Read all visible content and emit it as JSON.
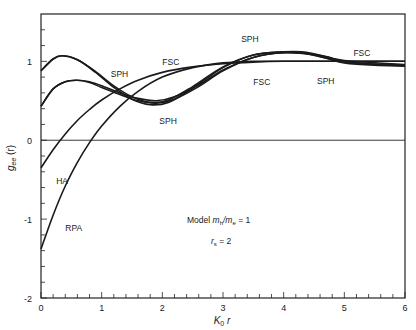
{
  "chart_data": {
    "type": "line",
    "title": "",
    "xlabel": "K₀ r",
    "ylabel": "gₐₐ (r)",
    "xlim": [
      0,
      6
    ],
    "ylim": [
      -2,
      1.6
    ],
    "x_ticks": [
      0,
      1,
      2,
      3,
      4,
      5,
      6
    ],
    "x_tick_labels": [
      "0",
      "1",
      "2",
      "3",
      "4",
      "5",
      "6"
    ],
    "y_ticks": [
      -2,
      -1,
      0,
      1
    ],
    "y_tick_labels": [
      "-2",
      "-1",
      "0",
      "1"
    ],
    "grid": false,
    "zero_line": true,
    "annotation": {
      "line1": "Model  mₕ/mₑ = 1",
      "line2": "rₛ = 2"
    },
    "series": [
      {
        "name": "SPH (upper)",
        "x": [
          0,
          0.2,
          0.35,
          0.6,
          0.9,
          1.2,
          1.5,
          1.8,
          2.1,
          2.5,
          3.0,
          3.5,
          4.0,
          4.3,
          4.7,
          5.0,
          5.5,
          6.0
        ],
        "y": [
          0.88,
          1.03,
          1.07,
          1.02,
          0.86,
          0.67,
          0.52,
          0.45,
          0.48,
          0.66,
          0.92,
          1.08,
          1.12,
          1.11,
          1.04,
          0.98,
          0.95,
          0.94
        ]
      },
      {
        "name": "FSC (upper)",
        "x": [
          0,
          0.2,
          0.35,
          0.6,
          0.9,
          1.2,
          1.5,
          1.8,
          2.1,
          2.5,
          3.0,
          3.5,
          4.0,
          4.3,
          4.7,
          5.0,
          5.5,
          6.0
        ],
        "y": [
          0.88,
          1.03,
          1.07,
          1.02,
          0.87,
          0.69,
          0.55,
          0.48,
          0.51,
          0.68,
          0.93,
          1.08,
          1.12,
          1.12,
          1.06,
          1.0,
          0.96,
          0.95
        ]
      },
      {
        "name": "SPH",
        "x": [
          0,
          0.2,
          0.4,
          0.6,
          0.8,
          1.0,
          1.3,
          1.6,
          1.9,
          2.2,
          2.6,
          3.0,
          3.5,
          4.0,
          4.5,
          5.0,
          6.0
        ],
        "y": [
          0.43,
          0.65,
          0.74,
          0.76,
          0.73,
          0.67,
          0.58,
          0.5,
          0.47,
          0.52,
          0.68,
          0.88,
          1.05,
          1.11,
          1.08,
          0.99,
          0.95
        ]
      },
      {
        "name": "FSC",
        "x": [
          0,
          0.2,
          0.4,
          0.6,
          0.8,
          1.0,
          1.3,
          1.6,
          1.9,
          2.2,
          2.6,
          3.0,
          3.5,
          4.0,
          4.5,
          5.0,
          6.0
        ],
        "y": [
          0.43,
          0.65,
          0.74,
          0.76,
          0.74,
          0.69,
          0.6,
          0.53,
          0.5,
          0.55,
          0.7,
          0.89,
          1.05,
          1.11,
          1.09,
          1.01,
          0.96
        ]
      },
      {
        "name": "HA",
        "x": [
          0,
          0.2,
          0.4,
          0.6,
          0.8,
          1.0,
          1.3,
          1.6,
          2.0,
          2.5,
          3.0,
          3.5,
          4.0,
          5.0,
          6.0
        ],
        "y": [
          -0.35,
          -0.12,
          0.08,
          0.25,
          0.39,
          0.51,
          0.65,
          0.76,
          0.86,
          0.93,
          0.97,
          0.99,
          1.0,
          1.0,
          1.0
        ]
      },
      {
        "name": "RPA",
        "x": [
          0,
          0.2,
          0.4,
          0.6,
          0.8,
          1.0,
          1.3,
          1.6,
          2.0,
          2.5,
          3.0,
          3.5,
          4.0,
          5.0,
          6.0
        ],
        "y": [
          -1.38,
          -0.95,
          -0.58,
          -0.28,
          -0.03,
          0.18,
          0.43,
          0.62,
          0.8,
          0.92,
          0.98,
          1.0,
          1.0,
          1.0,
          1.0
        ]
      }
    ],
    "labels": [
      {
        "text": "FSC",
        "x": 2.0,
        "y": 0.95
      },
      {
        "text": "SPH",
        "x": 1.15,
        "y": 0.8
      },
      {
        "text": "SPH",
        "x": 1.95,
        "y": 0.2
      },
      {
        "text": "SPH",
        "x": 3.3,
        "y": 1.25
      },
      {
        "text": "FSC",
        "x": 3.5,
        "y": 0.7
      },
      {
        "text": "FSC",
        "x": 5.15,
        "y": 1.07
      },
      {
        "text": "SPH",
        "x": 4.55,
        "y": 0.71
      },
      {
        "text": "HA",
        "x": 0.25,
        "y": -0.55
      },
      {
        "text": "RPA",
        "x": 0.4,
        "y": -1.15
      }
    ]
  },
  "axes": {
    "x_label_main": "K",
    "x_label_sub": "0",
    "x_label_tail": "r",
    "y_label_main": "g",
    "y_label_sub": "ee",
    "y_label_tail": "(r)"
  },
  "annotation": {
    "model_word": "Model",
    "ratio_m1": "m",
    "ratio_sub1": "h",
    "ratio_slash": "/m",
    "ratio_sub2": "e",
    "ratio_eq": "= 1",
    "rs_r": "r",
    "rs_sub": "s",
    "rs_eq": "= 2"
  },
  "colors": {
    "line": "#1a1a1a",
    "axis": "#222222",
    "background": "#ffffff"
  }
}
